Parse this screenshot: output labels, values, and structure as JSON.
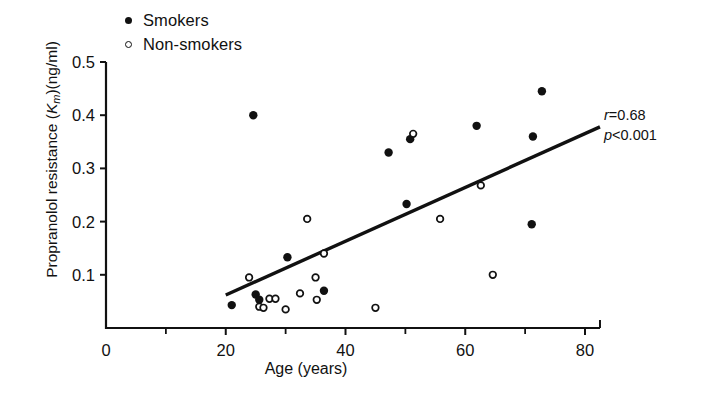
{
  "chart_data": {
    "type": "scatter",
    "title": "",
    "xlabel": "Age (years)",
    "ylabel_parts": {
      "pre": "Propranolol resistance (",
      "italic": "K",
      "sub": "m",
      "post": ")(ng/ml)"
    },
    "ylabel_plain": "Propranolol resistance (Km)(ng/ml)",
    "xlim": [
      0,
      82
    ],
    "ylim": [
      0,
      0.5
    ],
    "xticks": [
      0,
      20,
      40,
      60,
      80
    ],
    "xminorticks": [
      10,
      30,
      50,
      70
    ],
    "yticks": [
      0.1,
      0.2,
      0.3,
      0.4,
      0.5
    ],
    "grid": false,
    "legend_position": "top-left",
    "series": [
      {
        "name": "Smokers",
        "marker": "filled-circle",
        "color": "#111111",
        "points": [
          {
            "x": 21.0,
            "y": 0.043
          },
          {
            "x": 24.6,
            "y": 0.4
          },
          {
            "x": 25.0,
            "y": 0.063
          },
          {
            "x": 25.6,
            "y": 0.053
          },
          {
            "x": 30.3,
            "y": 0.133
          },
          {
            "x": 36.4,
            "y": 0.07
          },
          {
            "x": 47.2,
            "y": 0.33
          },
          {
            "x": 50.2,
            "y": 0.233
          },
          {
            "x": 50.8,
            "y": 0.355
          },
          {
            "x": 61.9,
            "y": 0.38
          },
          {
            "x": 71.1,
            "y": 0.195
          },
          {
            "x": 71.3,
            "y": 0.36
          },
          {
            "x": 72.8,
            "y": 0.445
          }
        ]
      },
      {
        "name": "Non-smokers",
        "marker": "open-circle",
        "color": "#111111",
        "points": [
          {
            "x": 23.9,
            "y": 0.095
          },
          {
            "x": 25.6,
            "y": 0.04
          },
          {
            "x": 26.3,
            "y": 0.038
          },
          {
            "x": 27.3,
            "y": 0.055
          },
          {
            "x": 28.3,
            "y": 0.055
          },
          {
            "x": 30.0,
            "y": 0.035
          },
          {
            "x": 32.4,
            "y": 0.065
          },
          {
            "x": 33.6,
            "y": 0.205
          },
          {
            "x": 35.0,
            "y": 0.095
          },
          {
            "x": 35.2,
            "y": 0.053
          },
          {
            "x": 36.4,
            "y": 0.14
          },
          {
            "x": 45.0,
            "y": 0.038
          },
          {
            "x": 51.3,
            "y": 0.365
          },
          {
            "x": 55.8,
            "y": 0.205
          },
          {
            "x": 62.6,
            "y": 0.268
          },
          {
            "x": 64.6,
            "y": 0.1
          }
        ]
      }
    ],
    "regression_line": {
      "x1": 20.0,
      "y1": 0.062,
      "x2": 82.5,
      "y2": 0.378
    },
    "annotations": [
      {
        "text_r": "r",
        "text_rval": "=0.68"
      },
      {
        "text_p": "p",
        "text_pval": "<0.001"
      }
    ]
  },
  "legend": {
    "items": [
      {
        "label": "Smokers",
        "marker": "filled-circle"
      },
      {
        "label": "Non-smokers",
        "marker": "open-circle"
      }
    ]
  },
  "axes": {
    "x_tick_labels": [
      "0",
      "20",
      "40",
      "60",
      "80"
    ],
    "y_tick_labels": [
      "0.1",
      "0.2",
      "0.3",
      "0.4",
      "0.5"
    ],
    "x_title": "Age (years)",
    "y_title_pre": "Propranolol resistance (",
    "y_title_italic": "K",
    "y_title_sub": "m",
    "y_title_post": ")(ng/ml)"
  },
  "stats": {
    "r_symbol": "r",
    "r_value": "=0.68",
    "p_symbol": "p",
    "p_value": "<0.001"
  }
}
